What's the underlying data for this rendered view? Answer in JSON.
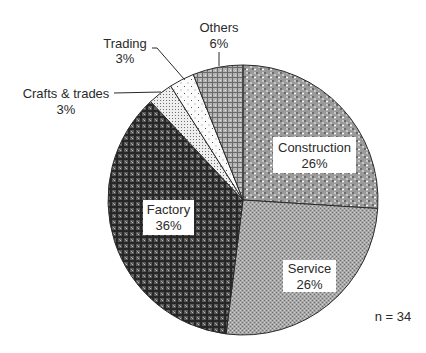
{
  "chart_data": {
    "type": "pie",
    "title": "",
    "start_angle_deg": 0,
    "direction": "clockwise",
    "categories": [
      "Construction",
      "Service",
      "Factory",
      "Crafts & trades",
      "Trading",
      "Others"
    ],
    "values": [
      26,
      26,
      36,
      3,
      3,
      6
    ],
    "value_labels": [
      "26%",
      "26%",
      "36%",
      "3%",
      "3%",
      "6%"
    ],
    "unit": "%",
    "annotation": "n = 34",
    "legend": "none (labels on/near slices)",
    "slices": [
      {
        "label": "Construction",
        "value": 26,
        "display": "26%",
        "pattern": "dots-light",
        "label_position": "inside-boxed"
      },
      {
        "label": "Service",
        "value": 26,
        "display": "26%",
        "pattern": "fine-checker",
        "label_position": "inside-boxed"
      },
      {
        "label": "Factory",
        "value": 36,
        "display": "36%",
        "pattern": "dark-cross",
        "label_position": "inside-boxed"
      },
      {
        "label": "Crafts & trades",
        "value": 3,
        "display": "3%",
        "pattern": "fine-dots",
        "label_position": "outside-leader"
      },
      {
        "label": "Trading",
        "value": 3,
        "display": "3%",
        "pattern": "sparse-dots",
        "label_position": "outside-leader"
      },
      {
        "label": "Others",
        "value": 6,
        "display": "6%",
        "pattern": "medium-cross",
        "label_position": "outside-leader"
      }
    ]
  },
  "labels": {
    "construction": {
      "name": "Construction",
      "pct": "26%"
    },
    "service": {
      "name": "Service",
      "pct": "26%"
    },
    "factory": {
      "name": "Factory",
      "pct": "36%"
    },
    "crafts": {
      "name": "Crafts & trades",
      "pct": "3%"
    },
    "trading": {
      "name": "Trading",
      "pct": "3%"
    },
    "others": {
      "name": "Others",
      "pct": "6%"
    }
  },
  "annotation": "n = 34",
  "colors": {
    "outline": "#2a2a2a",
    "text": "#2a2a2a",
    "background": "#ffffff"
  }
}
